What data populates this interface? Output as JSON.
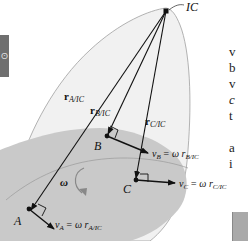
{
  "diagram": {
    "title_point": "IC",
    "points": [
      {
        "id": "A",
        "label": "A"
      },
      {
        "id": "B",
        "label": "B"
      },
      {
        "id": "C",
        "label": "C"
      }
    ],
    "position_vectors": [
      {
        "id": "rA",
        "main": "r",
        "sub": "A/IC"
      },
      {
        "id": "rB",
        "main": "r",
        "sub": "B/IC"
      },
      {
        "id": "rC",
        "main": "r",
        "sub": "C/IC"
      }
    ],
    "velocity_labels": [
      {
        "id": "vA",
        "lhs": "v",
        "lhs_sub": "A",
        "rhs": "= ω r",
        "rhs_sub": "A/IC"
      },
      {
        "id": "vB",
        "lhs": "v",
        "lhs_sub": "B",
        "rhs": "= ω r",
        "rhs_sub": "B/IC"
      },
      {
        "id": "vC",
        "lhs": "v",
        "lhs_sub": "C",
        "rhs": "= ω r",
        "rhs_sub": "C/IC"
      }
    ],
    "angular_velocity": "ω",
    "colors": {
      "body_fill": "#c9c9c9",
      "extended_body_fill": "#efefef",
      "outline": "#9a9a9a",
      "lines": "#111111"
    }
  },
  "side_tab": {
    "glyph": "ʘ"
  },
  "right_text": {
    "lines": [
      "v",
      "b",
      "v",
      "c",
      "t",
      "",
      "a",
      "i"
    ]
  }
}
